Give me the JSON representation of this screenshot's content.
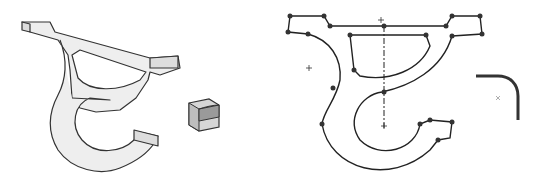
{
  "figure": {
    "background": "#ffffff",
    "panels": [
      {
        "id": "iso-part",
        "description": "3D isometric view of bracket part",
        "fill": "#eeeeee",
        "stroke": "#333333"
      },
      {
        "id": "view-cube",
        "description": "Shaded view-orientation cube",
        "fill": "#cfcfcf",
        "stroke": "#333333"
      },
      {
        "id": "sketch",
        "description": "2D sketch profile with constraint points and centerline",
        "stroke": "#222222"
      },
      {
        "id": "fillet-detail",
        "description": "Fillet corner detail",
        "stroke": "#333333"
      }
    ]
  }
}
